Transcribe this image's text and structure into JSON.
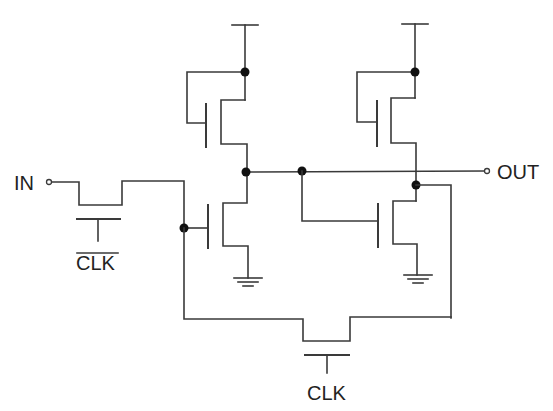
{
  "diagram": {
    "type": "circuit-schematic",
    "labels": {
      "input": "IN",
      "output": "OUT",
      "clock_bar": "CLK",
      "clock": "CLK"
    },
    "components": [
      {
        "id": "pass-transistor-clkbar",
        "kind": "nmos-pass",
        "gate": "CLK_bar"
      },
      {
        "id": "pmos-left",
        "kind": "pmos-load",
        "supply": "VDD"
      },
      {
        "id": "nmos-left",
        "kind": "nmos",
        "source": "GND"
      },
      {
        "id": "pmos-right",
        "kind": "pmos-load",
        "supply": "VDD"
      },
      {
        "id": "nmos-right",
        "kind": "nmos",
        "source": "GND"
      },
      {
        "id": "pass-transistor-clk",
        "kind": "nmos-pass",
        "gate": "CLK"
      }
    ],
    "colors": {
      "wire": "#3a3a3a",
      "junction": "#111111",
      "background": "#ffffff"
    }
  }
}
